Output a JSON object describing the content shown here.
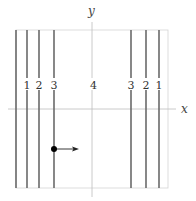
{
  "diagram": {
    "axes": {
      "x_label": "x",
      "y_label": "y",
      "axis_color": "#bbbbbb"
    },
    "box": {
      "left": 16,
      "top": 30,
      "right": 168,
      "bottom": 188,
      "color": "#cccccc"
    },
    "lines": [
      {
        "x": 16,
        "label": ""
      },
      {
        "x": 27,
        "label": "1"
      },
      {
        "x": 39,
        "label": "2"
      },
      {
        "x": 54,
        "label": "3"
      },
      {
        "x": 131,
        "label": "3"
      },
      {
        "x": 146,
        "label": "2"
      },
      {
        "x": 159,
        "label": "1"
      }
    ],
    "center_label": "4",
    "line_color": "#666666",
    "particle": {
      "x": 54,
      "y": 149,
      "arrow_to_x": 78,
      "color": "#000000"
    }
  }
}
